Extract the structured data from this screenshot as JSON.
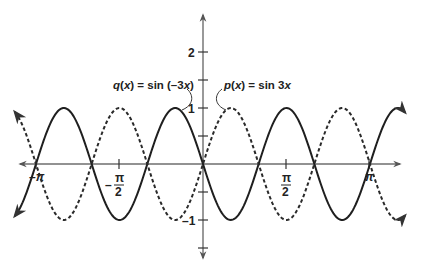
{
  "chart_data": {
    "type": "line",
    "title": "",
    "xlabel": "",
    "ylabel": "",
    "xlim": [
      -3.54,
      3.8
    ],
    "ylim": [
      -2.0,
      2.6
    ],
    "grid": false,
    "x_ticks": [
      {
        "value": -3.14159,
        "label": "-π"
      },
      {
        "value": -1.5708,
        "label": "-π/2"
      },
      {
        "value": 1.5708,
        "label": "π/2"
      },
      {
        "value": 3.14159,
        "label": "π"
      }
    ],
    "y_ticks": [
      {
        "value": 2,
        "label": "2"
      },
      {
        "value": 1.5,
        "label": ""
      },
      {
        "value": 1,
        "label": "1"
      },
      {
        "value": 0.5,
        "label": ""
      },
      {
        "value": -0.5,
        "label": ""
      },
      {
        "value": -1,
        "label": "-1"
      },
      {
        "value": -1.5,
        "label": ""
      }
    ],
    "series": [
      {
        "name": "q(x) = sin (–3x)",
        "formula": "sin(-3x)",
        "style": "solid",
        "amplitude": 1,
        "frequency": -3,
        "x_range": [
          -3.54,
          3.8
        ]
      },
      {
        "name": "p(x) = sin 3x",
        "formula": "sin(3x)",
        "style": "dashed",
        "amplitude": 1,
        "frequency": 3,
        "x_range": [
          -3.54,
          3.8
        ]
      }
    ],
    "annotations": [
      {
        "text": "q(x) = sin (–3x)",
        "points_to": "solid curve peak near x = -π/6"
      },
      {
        "text": "p(x) = sin 3x",
        "points_to": "dashed curve peak near x = π/6"
      }
    ],
    "legend": "none (inline labels)"
  },
  "labels": {
    "q": {
      "fn": "q",
      "var": "x",
      "rest_pre": " = sin (–3",
      "rest_post": ")"
    },
    "p": {
      "fn": "p",
      "var": "x",
      "rest_pre": " = sin 3"
    },
    "y_tick_2": "2",
    "y_tick_1": "1",
    "y_tick_neg1": "–1",
    "x_tick_negpi": "–π",
    "x_tick_negpi2_num": "π",
    "x_tick_negpi2_den": "2",
    "x_tick_negpi2_sign": "–",
    "x_tick_pi2_num": "π",
    "x_tick_pi2_den": "2",
    "x_tick_pi": "π"
  }
}
